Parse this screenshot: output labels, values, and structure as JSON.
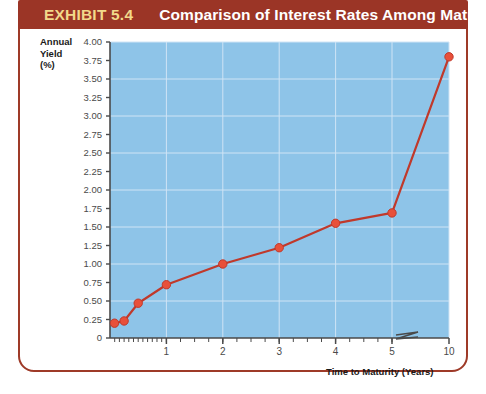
{
  "header": {
    "exhibit_number": "EXHIBIT 5.4",
    "title": "Comparison of Interest Rates Among Maturities",
    "bar_color": "#9b3526",
    "number_color": "#f2d98a",
    "title_color": "#ffffff"
  },
  "frame": {
    "border_color": "#9e3a28"
  },
  "chart_data": {
    "type": "line",
    "title": "Comparison of Interest Rates Among Maturities",
    "xlabel": "Time to Maturity (Years)",
    "ylabel": "Annual Yield (%)",
    "ylabel_lines": [
      "Annual",
      "Yield",
      "(%)"
    ],
    "plot_bg_color": "#8ec4e8",
    "series_color": "#c0392b",
    "marker_color": "#e8503a",
    "grid": true,
    "grid_color": "#cfe4f5",
    "legend": "none",
    "xlim": [
      0,
      10
    ],
    "ylim": [
      0,
      4.0
    ],
    "axis_break": {
      "present": true,
      "between": [
        5,
        10
      ],
      "symbol": "zigzag"
    },
    "ytick_labels": [
      "4.00",
      "3.75",
      "3.50",
      "3.25",
      "3.00",
      "2.75",
      "2.50",
      "2.25",
      "2.00",
      "1.75",
      "1.50",
      "1.25",
      "1.00",
      "0.75",
      "0.50",
      "0.25",
      "0"
    ],
    "ytick_values": [
      4.0,
      3.75,
      3.5,
      3.25,
      3.0,
      2.75,
      2.5,
      2.25,
      2.0,
      1.75,
      1.5,
      1.25,
      1.0,
      0.75,
      0.5,
      0.25,
      0
    ],
    "xtick_labels": [
      "1",
      "2",
      "3",
      "4",
      "5",
      "10"
    ],
    "xtick_values": [
      1,
      2,
      3,
      4,
      5,
      10
    ],
    "x": [
      0.08,
      0.25,
      0.5,
      1,
      2,
      3,
      4,
      5,
      10
    ],
    "values": [
      0.2,
      0.23,
      0.47,
      0.72,
      1.0,
      1.22,
      1.55,
      1.69,
      3.8
    ],
    "points": [
      {
        "x": 0.08,
        "y": 0.2
      },
      {
        "x": 0.25,
        "y": 0.23
      },
      {
        "x": 0.5,
        "y": 0.47
      },
      {
        "x": 1,
        "y": 0.72
      },
      {
        "x": 2,
        "y": 1.0
      },
      {
        "x": 3,
        "y": 1.22
      },
      {
        "x": 4,
        "y": 1.55
      },
      {
        "x": 5,
        "y": 1.69
      },
      {
        "x": 10,
        "y": 3.8
      }
    ]
  }
}
